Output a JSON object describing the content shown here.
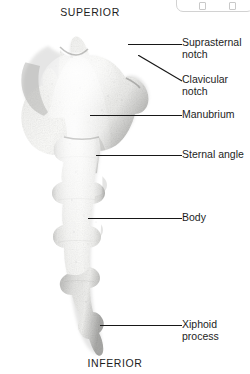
{
  "figure": {
    "view": "anterior",
    "background_color": "#ffffff",
    "bone_color": "#f1f1ef",
    "bone_shadow_color": "#a8a8a6",
    "leader_color": "#171717",
    "text_color": "#1d1d1d"
  },
  "orientation": {
    "superior": "SUPERIOR",
    "inferior": "INFERIOR"
  },
  "labels": {
    "suprasternal_notch": "Suprasternal\nnotch",
    "clavicular_notch": "Clavicular\nnotch",
    "manubrium": "Manubrium",
    "sternal_angle": "Sternal angle",
    "body": "Body",
    "xiphoid_process": "Xiphoid\nprocess"
  },
  "parts": [
    {
      "id": "suprasternal-notch",
      "label": "Suprasternal notch",
      "pointer": "horizontal"
    },
    {
      "id": "clavicular-notch",
      "label": "Clavicular notch",
      "pointer": "diagonal"
    },
    {
      "id": "manubrium",
      "label": "Manubrium",
      "pointer": "horizontal"
    },
    {
      "id": "sternal-angle",
      "label": "Sternal angle",
      "pointer": "horizontal"
    },
    {
      "id": "body",
      "label": "Body",
      "pointer": "horizontal"
    },
    {
      "id": "xiphoid-process",
      "label": "Xiphoid process",
      "pointer": "horizontal"
    }
  ]
}
